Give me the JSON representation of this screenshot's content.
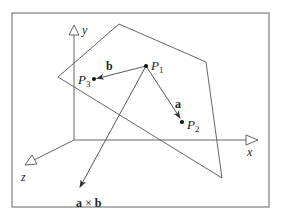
{
  "diagram": {
    "title": "",
    "colors": {
      "line": "#555555",
      "text": "#222222",
      "frame": "#666666",
      "background": "#ffffff"
    },
    "axes": {
      "x_label": "x",
      "y_label": "y",
      "z_label": "z"
    },
    "points": {
      "p1": {
        "label": "P",
        "sub": "1"
      },
      "p2": {
        "label": "P",
        "sub": "2"
      },
      "p3": {
        "label": "P",
        "sub": "3"
      }
    },
    "vectors": {
      "a": {
        "label": "a"
      },
      "b": {
        "label": "b"
      },
      "cross": {
        "label_a": "a",
        "op": "×",
        "label_b": "b"
      }
    }
  }
}
